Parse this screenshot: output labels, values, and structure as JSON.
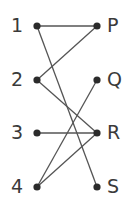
{
  "diagram": {
    "type": "matching",
    "left_nodes": [
      {
        "id": "1",
        "label": "1",
        "x": 37,
        "y": 26
      },
      {
        "id": "2",
        "label": "2",
        "x": 37,
        "y": 80
      },
      {
        "id": "3",
        "label": "3",
        "x": 37,
        "y": 133
      },
      {
        "id": "4",
        "label": "4",
        "x": 37,
        "y": 187
      }
    ],
    "right_nodes": [
      {
        "id": "P",
        "label": "P",
        "x": 97,
        "y": 26
      },
      {
        "id": "Q",
        "label": "Q",
        "x": 97,
        "y": 80
      },
      {
        "id": "R",
        "label": "R",
        "x": 97,
        "y": 133
      },
      {
        "id": "S",
        "label": "S",
        "x": 97,
        "y": 187
      }
    ],
    "edges": [
      [
        "1",
        "P"
      ],
      [
        "1",
        "S"
      ],
      [
        "2",
        "P"
      ],
      [
        "2",
        "R"
      ],
      [
        "3",
        "R"
      ],
      [
        "4",
        "Q"
      ],
      [
        "4",
        "R"
      ]
    ],
    "colors": {
      "line": "#555555",
      "dot": "#2b2b2b",
      "text": "#3a3a3a"
    }
  }
}
